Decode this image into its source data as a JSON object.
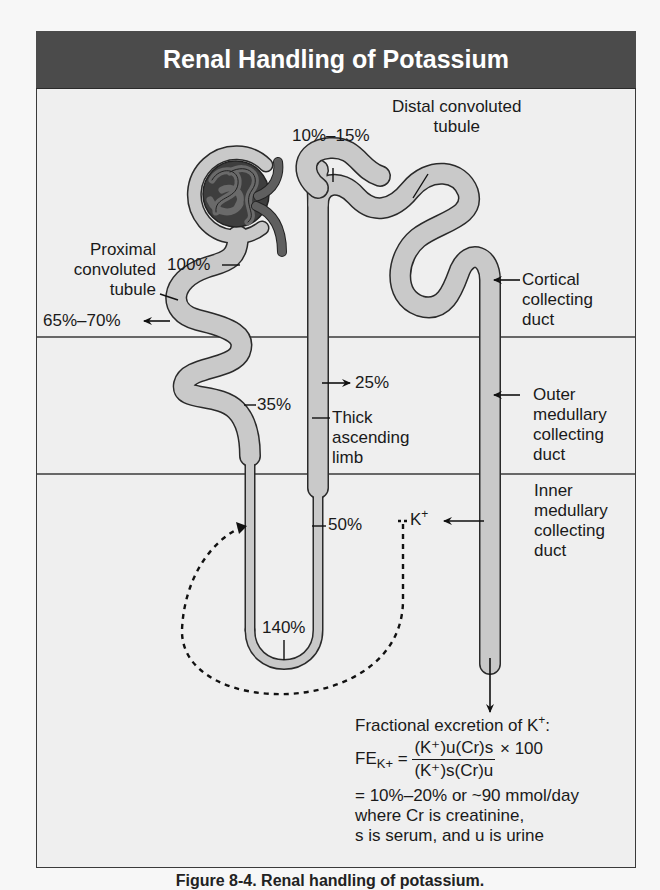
{
  "figure": {
    "title": "Renal Handling of Potassium",
    "caption": "Figure 8-4. Renal handling of potassium.",
    "colors": {
      "header_bg": "#4b4b4b",
      "header_text": "#ffffff",
      "panel_bg": "#efefef",
      "tubule_fill": "#c9c9c9",
      "tubule_outline": "#2a2a2a",
      "glomerulus": "#5a5a5a"
    }
  },
  "zones": [
    "Cortex",
    "Outer medulla",
    "Inner medulla"
  ],
  "structures": {
    "proximal": [
      "Proximal",
      "convoluted",
      "tubule"
    ],
    "distal": [
      "Distal convoluted",
      "tubule"
    ],
    "thick_limb": [
      "Thick",
      "ascending",
      "limb"
    ],
    "cortical_cd": [
      "Cortical",
      "collecting",
      "duct"
    ],
    "outer_cd": [
      "Outer",
      "medullary",
      "collecting",
      "duct"
    ],
    "inner_cd": [
      "Inner",
      "medullary",
      "collecting",
      "duct"
    ]
  },
  "percentages": {
    "filtered": "100%",
    "proximal_reabsorbed": "65%–70%",
    "end_proximal": "35%",
    "loop_tip": "140%",
    "thick_limb_reabsorbed": "25%",
    "thick_limb_lumen": "50%",
    "early_distal": "10%–15%"
  },
  "recycling": {
    "ion": "K",
    "charge": "+"
  },
  "formula": {
    "heading": "Fractional excretion of K",
    "heading_sup": "+",
    "heading_end": ":",
    "lhs": "FE",
    "lhs_sub": "K+",
    "eq": " = ",
    "numerator": "(K⁺)u(Cr)s",
    "denominator": "(K⁺)s(Cr)u",
    "times": " × 100",
    "result": "= 10%–20% or ~90 mmol/day",
    "where1": "where Cr is creatinine,",
    "where2": "s is serum, and u is urine"
  }
}
